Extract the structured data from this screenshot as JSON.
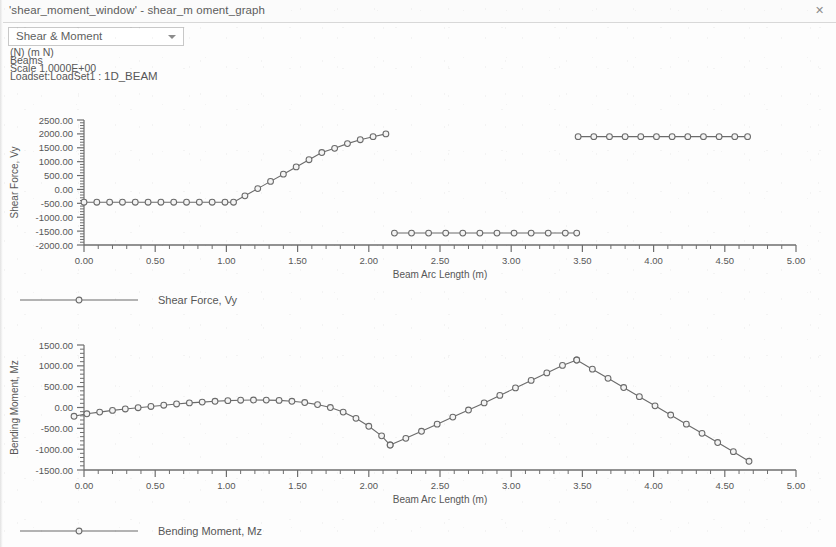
{
  "window": {
    "title": "'shear_moment_window' - shear_m oment_graph",
    "close_icon": "✕"
  },
  "toolbar": {
    "view_select": {
      "value": "Shear & Moment",
      "options": [
        "Shear & Moment",
        "Shear Force, Vy",
        "Bending Moment, Mz"
      ],
      "arrow_icon": "chevron-down-icon"
    }
  },
  "info": {
    "units": "(N)  (m N)",
    "entity": "Beams",
    "scale": "Scale  1.0000E+00",
    "loadset_prefix": "Loadset:LoadSet1 :",
    "loadset_name": "1D_BEAM"
  },
  "legends": {
    "shear": "Shear Force, Vy",
    "moment": "Bending Moment, Mz"
  },
  "style": {
    "line_color": "#6b6b6b",
    "axis_color": "#6e6e6e",
    "marker_fill": "#f4f4f4",
    "text_color": "#575757"
  },
  "chart_data": [
    {
      "id": "shear",
      "type": "line",
      "title": "",
      "xlabel": "Beam Arc Length (m)",
      "ylabel": "Shear Force, Vy",
      "xlim": [
        0.0,
        5.0
      ],
      "ylim": [
        -2000.0,
        2500.0
      ],
      "xticks": [
        0.0,
        0.5,
        1.0,
        1.5,
        2.0,
        2.5,
        3.0,
        3.5,
        4.0,
        4.5,
        5.0
      ],
      "xticklabels": [
        "0.00",
        "0.50",
        "1.00",
        "1.50",
        "2.00",
        "2.50",
        "3.00",
        "3.50",
        "4.00",
        "4.50",
        "5.00"
      ],
      "yticks": [
        -2000,
        -1500,
        -1000,
        -500,
        0,
        500,
        1000,
        1500,
        2000,
        2500
      ],
      "yticklabels": [
        "-2000.00",
        "-1500.00",
        "-1000.00",
        "-500.00",
        "0.00",
        "500.00",
        "1000.00",
        "1500.00",
        "2000.00",
        "2500.00"
      ],
      "minor_ticks_per_interval": 5,
      "grid": false,
      "legend_position": "below",
      "markers": "open-circle",
      "series": [
        {
          "name": "Shear Force, Vy",
          "segments": [
            {
              "x": [
                0.0,
                0.09,
                0.18,
                0.27,
                0.36,
                0.45,
                0.54,
                0.63,
                0.72,
                0.81,
                0.9,
                0.99,
                1.05,
                1.13,
                1.22,
                1.31,
                1.4,
                1.49,
                1.58,
                1.67,
                1.76,
                1.85,
                1.94,
                2.03,
                2.12
              ],
              "y": [
                -460,
                -460,
                -460,
                -460,
                -460,
                -460,
                -460,
                -460,
                -460,
                -460,
                -460,
                -460,
                -460,
                -230,
                30,
                290,
                550,
                810,
                1070,
                1330,
                1480,
                1650,
                1790,
                1900,
                2000
              ]
            },
            {
              "x": [
                2.18,
                2.3,
                2.42,
                2.54,
                2.66,
                2.78,
                2.9,
                3.02,
                3.14,
                3.26,
                3.38,
                3.46
              ],
              "y": [
                -1570,
                -1570,
                -1570,
                -1570,
                -1570,
                -1570,
                -1570,
                -1570,
                -1570,
                -1570,
                -1570,
                -1570
              ]
            },
            {
              "x": [
                3.47,
                3.58,
                3.69,
                3.8,
                3.91,
                4.02,
                4.13,
                4.24,
                4.35,
                4.46,
                4.57,
                4.66
              ],
              "y": [
                1900,
                1900,
                1900,
                1900,
                1900,
                1900,
                1900,
                1900,
                1900,
                1900,
                1900,
                1900
              ]
            }
          ]
        }
      ]
    },
    {
      "id": "moment",
      "type": "line",
      "title": "",
      "xlabel": "Beam Arc Length (m)",
      "ylabel": "Bending Moment, Mz",
      "xlim": [
        0.0,
        5.0
      ],
      "ylim": [
        -1500.0,
        1500.0
      ],
      "xticks": [
        0.0,
        0.5,
        1.0,
        1.5,
        2.0,
        2.5,
        3.0,
        3.5,
        4.0,
        4.5,
        5.0
      ],
      "xticklabels": [
        "0.00",
        "0.50",
        "1.00",
        "1.50",
        "2.00",
        "2.50",
        "3.00",
        "3.50",
        "4.00",
        "4.50",
        "5.00"
      ],
      "yticks": [
        -1500,
        -1000,
        -500,
        0,
        500,
        1000,
        1500
      ],
      "yticklabels": [
        "-1500.00",
        "-1000.00",
        "-500.00",
        "0.00",
        "500.00",
        "1000.00",
        "1500.00"
      ],
      "minor_ticks_per_interval": 5,
      "grid": false,
      "legend_position": "below",
      "markers": "open-circle",
      "series": [
        {
          "name": "Bending Moment, Mz",
          "segments": [
            {
              "x": [
                -0.07,
                0.02,
                0.11,
                0.2,
                0.29,
                0.38,
                0.47,
                0.56,
                0.65,
                0.74,
                0.83,
                0.92,
                1.01,
                1.1,
                1.19,
                1.28,
                1.37,
                1.46,
                1.55,
                1.64,
                1.73,
                1.82,
                1.91,
                2.0,
                2.09,
                2.15
              ],
              "y": [
                -210,
                -150,
                -110,
                -70,
                -35,
                -5,
                25,
                55,
                85,
                110,
                130,
                150,
                165,
                175,
                180,
                178,
                170,
                150,
                120,
                70,
                0,
                -110,
                -260,
                -450,
                -680,
                -900
              ]
            },
            {
              "x": [
                2.15,
                2.26,
                2.37,
                2.48,
                2.59,
                2.7,
                2.81,
                2.92,
                3.03,
                3.14,
                3.25,
                3.36,
                3.46
              ],
              "y": [
                -900,
                -740,
                -570,
                -400,
                -230,
                -60,
                110,
                290,
                470,
                650,
                830,
                1010,
                1140
              ]
            },
            {
              "x": [
                3.46,
                3.57,
                3.68,
                3.79,
                3.9,
                4.01,
                4.12,
                4.23,
                4.34,
                4.45,
                4.56,
                4.67
              ],
              "y": [
                1140,
                920,
                700,
                480,
                260,
                40,
                -180,
                -400,
                -620,
                -840,
                -1060,
                -1290
              ]
            }
          ]
        }
      ]
    }
  ]
}
